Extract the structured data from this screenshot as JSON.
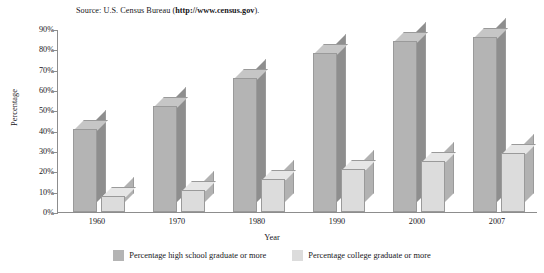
{
  "source_note": {
    "prefix": "Source: U.S. Census Bureau (",
    "url": "http://www.census.gov",
    "suffix": ")."
  },
  "chart_data": {
    "type": "bar",
    "title": "",
    "subtitle": "",
    "xlabel": "Year",
    "ylabel": "Percentage",
    "categories": [
      "1960",
      "1970",
      "1980",
      "1990",
      "2000",
      "2007"
    ],
    "ylim": [
      0,
      90
    ],
    "yticks": [
      "0%",
      "10%",
      "20%",
      "30%",
      "40%",
      "50%",
      "60%",
      "70%",
      "80%",
      "90%"
    ],
    "ytick_values": [
      0,
      10,
      20,
      30,
      40,
      50,
      60,
      70,
      80,
      90
    ],
    "grid": false,
    "legend_position": "bottom",
    "three_d": true,
    "series": [
      {
        "name": "Percentage high school graduate or more",
        "color": "#b4b4b4",
        "values": [
          41,
          52,
          66,
          78,
          84,
          86
        ]
      },
      {
        "name": "Percentage college graduate or more",
        "color": "#dcdcdc",
        "values": [
          8,
          11,
          16,
          21,
          25,
          29
        ]
      }
    ]
  },
  "legend": {
    "entries": [
      {
        "label": "Percentage high school graduate or more",
        "swatch": "hs"
      },
      {
        "label": "Percentage college graduate or more",
        "swatch": "col"
      }
    ]
  }
}
